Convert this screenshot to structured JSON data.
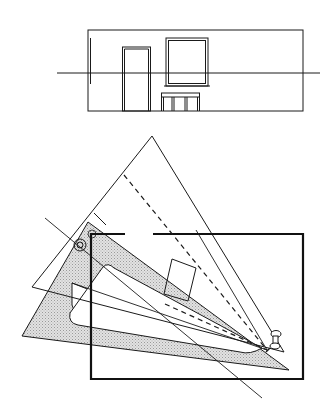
{
  "figure": {
    "description": "Perspective drawing setup: wall elevation above, and a triangle set (set square) rotated on a drawing board with pin and dashed projection lines",
    "colors": {
      "line": "#1a1a1a",
      "shade": "#cfcfcf",
      "background": "#ffffff"
    },
    "elevation": {
      "label": "wall-elevation",
      "horizon_line": "horizon line",
      "items": [
        "door",
        "window",
        "table"
      ]
    },
    "plan": {
      "label": "triangle-and-board",
      "items": [
        "set square (large triangle)",
        "shaded triangle",
        "picture plane frame",
        "pin",
        "target circle",
        "dashed projection lines",
        "small rotated square"
      ]
    }
  }
}
